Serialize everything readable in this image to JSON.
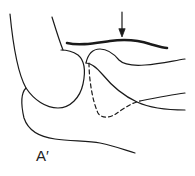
{
  "figure": {
    "label": "A′",
    "label_position": {
      "x": 36,
      "y": 148
    },
    "colors": {
      "stroke": "#1a1a1a",
      "background": "#ffffff"
    },
    "elements": [
      {
        "name": "outer-contour",
        "style": "solid",
        "description": "left rounded contour"
      },
      {
        "name": "upper-contour",
        "style": "solid"
      },
      {
        "name": "thick-bar",
        "style": "thick solid"
      },
      {
        "name": "arrow",
        "style": "downward arrow pointing to thick bar"
      },
      {
        "name": "upper-right-curve",
        "style": "solid"
      },
      {
        "name": "middle-right-curve",
        "style": "solid"
      },
      {
        "name": "dashed-curve",
        "style": "dashed"
      },
      {
        "name": "lower-contour",
        "style": "solid"
      }
    ]
  }
}
